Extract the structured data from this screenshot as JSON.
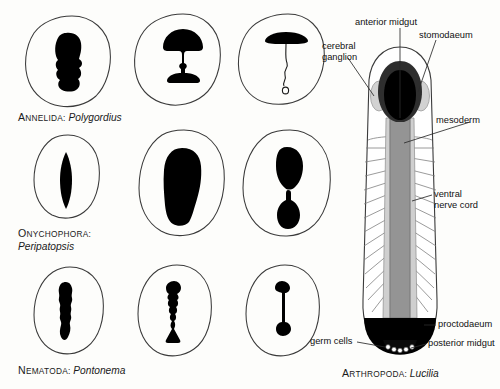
{
  "figure": {
    "title_absent": true,
    "background": "#fdfdfb",
    "ink": "#111111",
    "fills": {
      "black": "#000000",
      "dark_gray": "#333333",
      "mid_gray": "#8a8a8a",
      "light_gray": "#c9c9c9",
      "pale_gray": "#d9d9d9",
      "white": "#ffffff"
    }
  },
  "rows": [
    {
      "taxon_caps": "A",
      "taxon_rest": "NNELIDA",
      "taxon_colon": ":",
      "genus": "Polygordius",
      "caption_lines": 1,
      "panels": [
        {
          "name": "annelida-stage-1",
          "shape": "lumpy-blob"
        },
        {
          "name": "annelida-stage-2",
          "shape": "cap-stalk-flare"
        },
        {
          "name": "annelida-stage-3",
          "shape": "umbrella-thread-loop"
        }
      ]
    },
    {
      "taxon_caps": "O",
      "taxon_rest": "NYCHOPHORA",
      "taxon_colon": ":",
      "genus": "Peripatopsis",
      "caption_lines": 2,
      "panels": [
        {
          "name": "onychophora-stage-1",
          "shape": "narrow-spindle"
        },
        {
          "name": "onychophora-stage-2",
          "shape": "broad-boot"
        },
        {
          "name": "onychophora-stage-3",
          "shape": "dumbbell-two-lobes"
        }
      ]
    },
    {
      "taxon_caps": "N",
      "taxon_rest": "EMATODA",
      "taxon_colon": ":",
      "genus": "Pontonema",
      "caption_lines": 1,
      "panels": [
        {
          "name": "nematoda-stage-1",
          "shape": "thick-beaded-rod"
        },
        {
          "name": "nematoda-stage-2",
          "shape": "thin-beaded-rod"
        },
        {
          "name": "nematoda-stage-3",
          "shape": "thread-with-end-knobs"
        }
      ]
    }
  ],
  "arthropod": {
    "taxon_caps": "A",
    "taxon_rest": "RTHROPODA",
    "taxon_colon": ":",
    "genus": "Lucilia",
    "labels": [
      {
        "name": "label-anterior-midgut",
        "text": "anterior midgut"
      },
      {
        "name": "label-stomodaeum",
        "text": "stomodaeum"
      },
      {
        "name": "label-cerebral-ganglion",
        "line1": "cerebral",
        "line2": "ganglion"
      },
      {
        "name": "label-mesoderm",
        "text": "mesoderm"
      },
      {
        "name": "label-ventral-nerve-cord",
        "line1": "ventral",
        "line2": "nerve cord"
      },
      {
        "name": "label-proctodaeum",
        "text": "proctodaeum"
      },
      {
        "name": "label-posterior-midgut",
        "text": "posterior midgut"
      },
      {
        "name": "label-germ-cells",
        "text": "germ cells"
      }
    ]
  }
}
